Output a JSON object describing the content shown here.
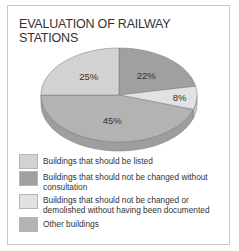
{
  "chart_data": {
    "type": "pie",
    "title": "EVALUATION OF RAILWAY STATIONS",
    "title_lines": [
      "EVALUATION OF RAILWAY",
      "STATIONS"
    ],
    "style": "3d",
    "start": "top",
    "direction": "clockwise",
    "slices": [
      {
        "label": "Buildings that should not be changed without consultation",
        "value": 22,
        "display": "22%",
        "color": "#a0a0a0"
      },
      {
        "label": "Buildings that should not be changed or demolished without having been documented",
        "value": 8,
        "display": "8%",
        "color": "#e2e2e2"
      },
      {
        "label": "Other buildings",
        "value": 45,
        "display": "45%",
        "color": "#b3b3b3"
      },
      {
        "label": "Buildings that should be listed",
        "value": 25,
        "display": "25%",
        "color": "#d2d2d2"
      }
    ],
    "legend": [
      {
        "label": "Buildings that should be listed",
        "color": "#d2d2d2"
      },
      {
        "label": "Buildings that should not be changed without consultation",
        "color": "#a0a0a0"
      },
      {
        "label": "Buildings that should not be changed or demolished without having been documented",
        "color": "#e2e2e2"
      },
      {
        "label": "Other buildings",
        "color": "#b3b3b3"
      }
    ],
    "legend_position": "bottom"
  }
}
